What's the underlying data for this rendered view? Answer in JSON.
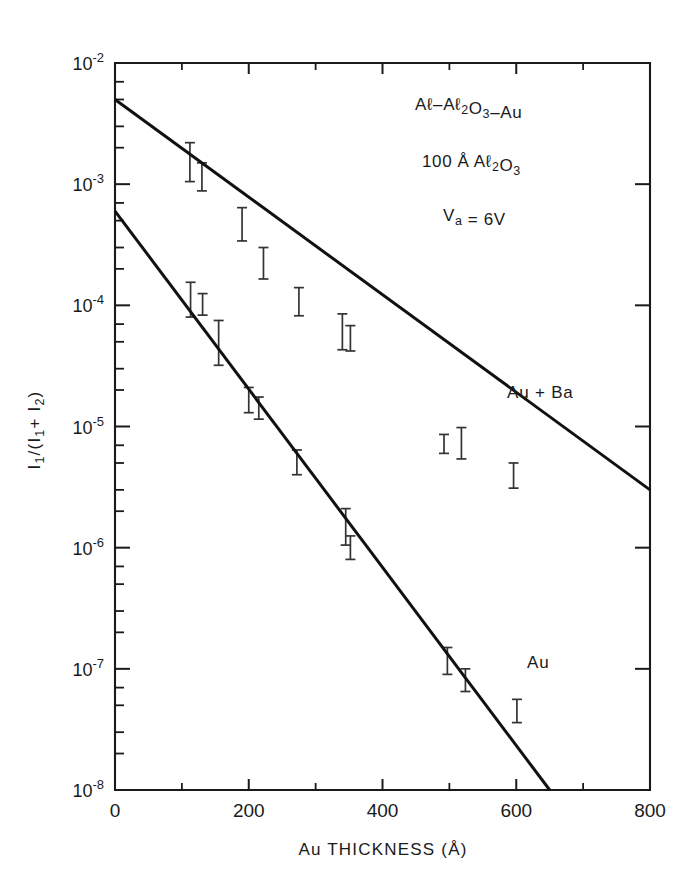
{
  "chart_data": {
    "type": "line",
    "title": "",
    "xlabel": "Au  THICKNESS  (Å)",
    "ylabel": "I₁/(I₁+I₂)",
    "xlim": [
      0,
      800
    ],
    "ylim": [
      1e-08,
      0.01
    ],
    "yscale": "log",
    "xscale": "linear",
    "grid": false,
    "legend_position": "inline-annotation",
    "xticks": [
      0,
      100,
      200,
      300,
      400,
      500,
      600,
      700,
      800
    ],
    "xtick_labels": [
      "0",
      "",
      "200",
      "",
      "400",
      "",
      "600",
      "",
      "800"
    ],
    "yticks": [
      1e-08,
      1e-07,
      1e-06,
      1e-05,
      0.0001,
      0.001,
      0.01
    ],
    "ytick_labels": [
      "10⁻⁸",
      "10⁻⁷",
      "10⁻⁶",
      "10⁻⁵",
      "10⁻⁴",
      "10⁻³",
      "10⁻²"
    ],
    "series": [
      {
        "name": "Au + Ba",
        "label": "Au + Ba",
        "fit_line": {
          "x": [
            0,
            800
          ],
          "y": [
            0.005,
            3e-06
          ]
        },
        "points": [
          {
            "x": 112,
            "y": 0.00155,
            "yerr_low": 0.00105,
            "yerr_high": 0.0022
          },
          {
            "x": 130,
            "y": 0.00115,
            "yerr_low": 0.00088,
            "yerr_high": 0.0015
          },
          {
            "x": 190,
            "y": 0.00046,
            "yerr_low": 0.00034,
            "yerr_high": 0.00064
          },
          {
            "x": 222,
            "y": 0.00022,
            "yerr_low": 0.000165,
            "yerr_high": 0.0003
          },
          {
            "x": 275,
            "y": 0.000105,
            "yerr_low": 8.2e-05,
            "yerr_high": 0.00014
          },
          {
            "x": 340,
            "y": 5.6e-05,
            "yerr_low": 4.3e-05,
            "yerr_high": 8.5e-05
          },
          {
            "x": 352,
            "y": 5.3e-05,
            "yerr_low": 4.2e-05,
            "yerr_high": 6.8e-05
          },
          {
            "x": 492,
            "y": 7.2e-06,
            "yerr_low": 6e-06,
            "yerr_high": 8.6e-06
          },
          {
            "x": 518,
            "y": 7e-06,
            "yerr_low": 5.4e-06,
            "yerr_high": 9.8e-06
          },
          {
            "x": 596,
            "y": 3.9e-06,
            "yerr_low": 3.1e-06,
            "yerr_high": 5e-06
          }
        ]
      },
      {
        "name": "Au",
        "label": "Au",
        "fit_line": {
          "x": [
            0,
            650
          ],
          "y": [
            0.0006,
            1e-08
          ]
        },
        "points": [
          {
            "x": 113,
            "y": 0.00011,
            "yerr_low": 8e-05,
            "yerr_high": 0.000155
          },
          {
            "x": 131,
            "y": 0.0001,
            "yerr_low": 8.3e-05,
            "yerr_high": 0.000125
          },
          {
            "x": 155,
            "y": 5e-05,
            "yerr_low": 3.2e-05,
            "yerr_high": 7.5e-05
          },
          {
            "x": 200,
            "y": 1.65e-05,
            "yerr_low": 1.3e-05,
            "yerr_high": 2.1e-05
          },
          {
            "x": 215,
            "y": 1.4e-05,
            "yerr_low": 1.15e-05,
            "yerr_high": 1.75e-05
          },
          {
            "x": 272,
            "y": 5e-06,
            "yerr_low": 4e-06,
            "yerr_high": 6.4e-06
          },
          {
            "x": 345,
            "y": 1.4e-06,
            "yerr_low": 1.05e-06,
            "yerr_high": 2.1e-06
          },
          {
            "x": 352,
            "y": 1e-06,
            "yerr_low": 8e-07,
            "yerr_high": 1.25e-06
          },
          {
            "x": 497,
            "y": 1.15e-07,
            "yerr_low": 9e-08,
            "yerr_high": 1.5e-07
          },
          {
            "x": 524,
            "y": 8e-08,
            "yerr_low": 6.5e-08,
            "yerr_high": 1e-07
          },
          {
            "x": 601,
            "y": 4.4e-08,
            "yerr_low": 3.6e-08,
            "yerr_high": 5.6e-08
          }
        ]
      }
    ],
    "annotations": [
      {
        "id": "stack",
        "text": "Aℓ–Aℓ₂O₃–Au",
        "x": 415,
        "y": 110
      },
      {
        "id": "oxide-thickness",
        "text": "100 Å  Aℓ₂O₃",
        "x": 422,
        "y": 167
      },
      {
        "id": "applied-voltage",
        "text": "Vₐ = 6V",
        "x": 443,
        "y": 221
      },
      {
        "id": "series-au-ba",
        "text": "Au + Ba",
        "x": 507,
        "y": 398
      },
      {
        "id": "series-au",
        "text": "Au",
        "x": 527,
        "y": 668
      }
    ]
  },
  "axes": {
    "x_title": "Au  THICKNESS  (Å)",
    "y_title_parts": {
      "num": "I",
      "num_sub": "1",
      "slash": "/",
      "open": "(I",
      "a_sub": "1",
      "plus": "+ I",
      "b_sub": "2",
      "close": ")"
    }
  }
}
